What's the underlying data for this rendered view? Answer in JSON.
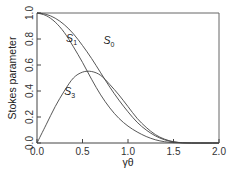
{
  "chart_data": {
    "type": "line",
    "title": "",
    "xlabel": "γθ",
    "ylabel": "Stokes parameter",
    "xlim": [
      0.0,
      2.0
    ],
    "ylim": [
      0.0,
      1.0
    ],
    "grid": false,
    "legend": "inline labels",
    "x_ticks": [
      "0.0",
      "0.5",
      "1.0",
      "1.5",
      "2.0"
    ],
    "y_ticks": [
      "0.0",
      "0.2",
      "0.4",
      "0.6",
      "0.8",
      "1.0"
    ],
    "x": [
      0.0,
      0.1,
      0.2,
      0.3,
      0.4,
      0.5,
      0.6,
      0.7,
      0.8,
      0.9,
      1.0,
      1.1,
      1.2,
      1.3,
      1.4,
      1.5,
      1.6,
      1.7,
      1.8,
      1.9,
      2.0
    ],
    "series": [
      {
        "name": "S0",
        "label_main": "S",
        "label_sub": "0",
        "values": [
          1.0,
          0.99,
          0.96,
          0.91,
          0.84,
          0.75,
          0.65,
          0.54,
          0.43,
          0.33,
          0.24,
          0.16,
          0.1,
          0.055,
          0.025,
          0.008,
          0.002,
          0.0,
          0.0,
          0.0,
          0.0
        ]
      },
      {
        "name": "S1",
        "label_main": "S",
        "label_sub": "1",
        "values": [
          1.0,
          0.98,
          0.93,
          0.85,
          0.74,
          0.62,
          0.49,
          0.37,
          0.27,
          0.19,
          0.13,
          0.085,
          0.05,
          0.025,
          0.01,
          0.003,
          0.0,
          0.0,
          0.0,
          0.0,
          0.0
        ]
      },
      {
        "name": "S3",
        "label_main": "S",
        "label_sub": "3",
        "values": [
          0.0,
          0.14,
          0.28,
          0.4,
          0.5,
          0.545,
          0.55,
          0.52,
          0.45,
          0.37,
          0.28,
          0.19,
          0.12,
          0.065,
          0.03,
          0.01,
          0.002,
          0.0,
          0.0,
          0.0,
          0.0
        ]
      }
    ],
    "annotations": [
      {
        "text_main": "S",
        "text_sub": "1",
        "x": 0.32,
        "y": 0.78
      },
      {
        "text_main": "S",
        "text_sub": "0",
        "x": 0.73,
        "y": 0.76
      },
      {
        "text_main": "S",
        "text_sub": "3",
        "x": 0.3,
        "y": 0.37
      }
    ]
  }
}
